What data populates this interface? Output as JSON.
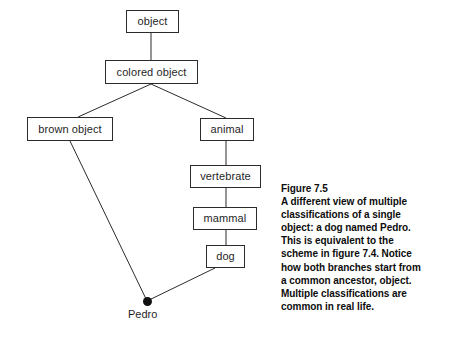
{
  "figure": {
    "background_color": "#ffffff",
    "stroke_color": "#2b2b2b",
    "text_color": "#1f1f1f"
  },
  "diagram": {
    "nodes": [
      {
        "id": "object",
        "label": "object",
        "x": 126,
        "y": 10,
        "w": 53,
        "h": 23
      },
      {
        "id": "colored-object",
        "label": "colored object",
        "x": 105,
        "y": 60,
        "w": 93,
        "h": 24
      },
      {
        "id": "brown-object",
        "label": "brown object",
        "x": 27,
        "y": 117,
        "w": 86,
        "h": 24
      },
      {
        "id": "animal",
        "label": "animal",
        "x": 200,
        "y": 118,
        "w": 54,
        "h": 23
      },
      {
        "id": "vertebrate",
        "label": "vertebrate",
        "x": 190,
        "y": 165,
        "w": 71,
        "h": 23
      },
      {
        "id": "mammal",
        "label": "mammal",
        "x": 193,
        "y": 207,
        "w": 64,
        "h": 23
      },
      {
        "id": "dog",
        "label": "dog",
        "x": 206,
        "y": 245,
        "w": 39,
        "h": 23
      }
    ],
    "instance": {
      "id": "pedro",
      "label": "Pedro",
      "dot_x": 147,
      "dot_y": 301,
      "label_x": 128,
      "label_y": 309
    },
    "edges": [
      {
        "id": "object-to-colored-object",
        "x1": 151,
        "y1": 33,
        "x2": 151,
        "y2": 60
      },
      {
        "id": "colored-object-to-brown",
        "x1": 151,
        "y1": 84,
        "x2": 78,
        "y2": 117
      },
      {
        "id": "colored-object-to-animal",
        "x1": 151,
        "y1": 84,
        "x2": 226,
        "y2": 118
      },
      {
        "id": "animal-to-vertebrate",
        "x1": 226,
        "y1": 141,
        "x2": 226,
        "y2": 165
      },
      {
        "id": "vertebrate-to-mammal",
        "x1": 226,
        "y1": 188,
        "x2": 226,
        "y2": 207
      },
      {
        "id": "mammal-to-dog",
        "x1": 226,
        "y1": 230,
        "x2": 226,
        "y2": 245
      },
      {
        "id": "brown-object-to-pedro",
        "x1": 70,
        "y1": 141,
        "x2": 147,
        "y2": 301
      },
      {
        "id": "dog-to-pedro",
        "x1": 215,
        "y1": 268,
        "x2": 147,
        "y2": 301
      }
    ]
  },
  "caption": {
    "lines": [
      "Figure 7.5",
      "A different view of multiple",
      "classifications of a single",
      "object: a dog named Pedro.",
      "This is equivalent to the",
      "scheme in figure 7.4. Notice",
      "how both branches start from",
      "a common ancestor, object.",
      "Multiple classifications are",
      "common in real life."
    ]
  }
}
